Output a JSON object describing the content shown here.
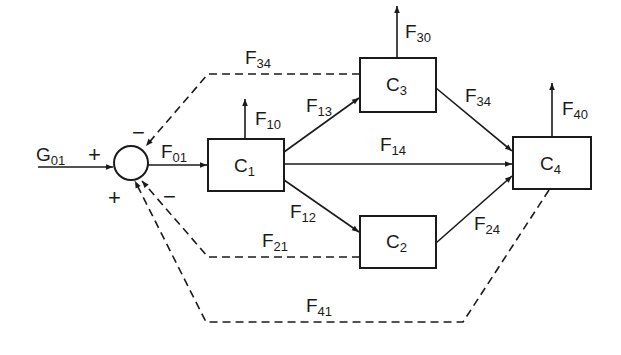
{
  "diagram": {
    "type": "compartment flow block diagram",
    "colors": {
      "ink": "#1a1a1a",
      "background": "#ffffff"
    },
    "junction": {
      "signs": {
        "input": "+",
        "top_feedback": "−",
        "bottom_left": "+",
        "bottom_right": "−"
      }
    },
    "input": {
      "label": "G",
      "sub": "01"
    },
    "compartments": [
      {
        "id": "C1",
        "label": "C",
        "sub": "1"
      },
      {
        "id": "C2",
        "label": "C",
        "sub": "2"
      },
      {
        "id": "C3",
        "label": "C",
        "sub": "3"
      },
      {
        "id": "C4",
        "label": "C",
        "sub": "4"
      }
    ],
    "flows": {
      "F01": {
        "label": "F",
        "sub": "01"
      },
      "F10": {
        "label": "F",
        "sub": "10"
      },
      "F12": {
        "label": "F",
        "sub": "12"
      },
      "F13": {
        "label": "F",
        "sub": "13"
      },
      "F14": {
        "label": "F",
        "sub": "14"
      },
      "F24": {
        "label": "F",
        "sub": "24"
      },
      "F34": {
        "label": "F",
        "sub": "34"
      },
      "F30": {
        "label": "F",
        "sub": "30"
      },
      "F40": {
        "label": "F",
        "sub": "40"
      },
      "F34_feedback": {
        "label": "F",
        "sub": "34"
      },
      "F21_feedback": {
        "label": "F",
        "sub": "21"
      },
      "F41_feedback": {
        "label": "F",
        "sub": "41"
      }
    }
  }
}
